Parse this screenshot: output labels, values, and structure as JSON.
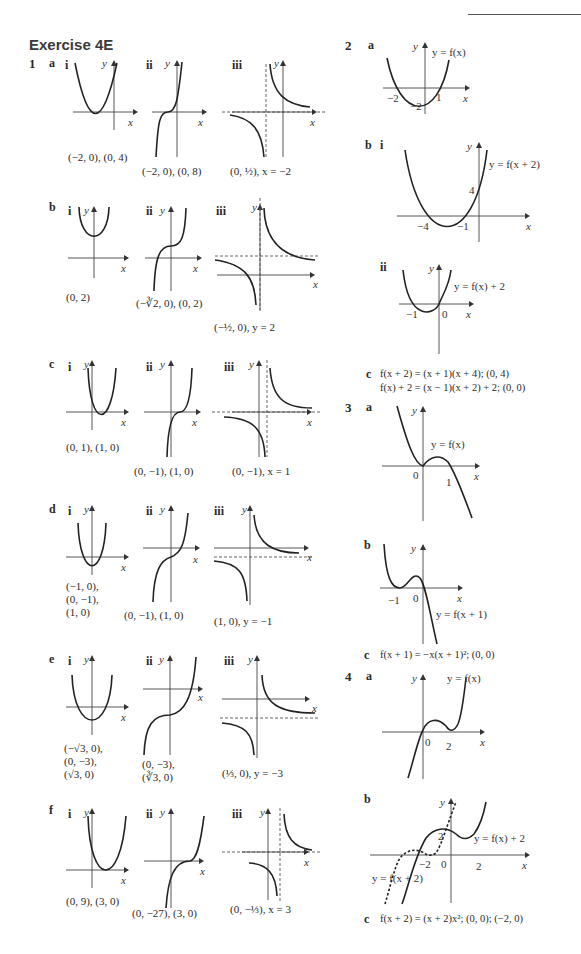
{
  "header": {
    "title": "Exercise 4E"
  },
  "q1": {
    "number": "1",
    "parts": {
      "a": {
        "label": "a",
        "i": {
          "label": "i",
          "caption": "(−2, 0), (0, 4)"
        },
        "ii": {
          "label": "ii",
          "caption": "(−2, 0), (0, 8)"
        },
        "iii": {
          "label": "iii",
          "caption": "(0, ½), x = −2"
        }
      },
      "b": {
        "label": "b",
        "i": {
          "label": "i",
          "caption": "(0, 2)"
        },
        "ii": {
          "label": "ii",
          "caption": "(−∛2, 0), (0, 2)"
        },
        "iii": {
          "label": "iii",
          "caption": "(−½, 0), y = 2"
        }
      },
      "c": {
        "label": "c",
        "i": {
          "label": "i",
          "caption": "(0, 1), (1, 0)"
        },
        "ii": {
          "label": "ii",
          "caption": "(0, −1), (1, 0)"
        },
        "iii": {
          "label": "iii",
          "caption": "(0, −1), x = 1"
        }
      },
      "d": {
        "label": "d",
        "i": {
          "label": "i",
          "caption_lines": [
            "(−1, 0),",
            "(0, −1),",
            "(1, 0)"
          ]
        },
        "ii": {
          "label": "ii",
          "caption": "(0, −1), (1, 0)"
        },
        "iii": {
          "label": "iii",
          "caption": "(1, 0), y = −1"
        }
      },
      "e": {
        "label": "e",
        "i": {
          "label": "i",
          "caption_lines": [
            "(−√3, 0),",
            "(0, −3),",
            "(√3, 0)"
          ]
        },
        "ii": {
          "label": "ii",
          "caption_lines": [
            "(0, −3),",
            "(∛3, 0)"
          ]
        },
        "iii": {
          "label": "iii",
          "caption": "(⅓, 0), y = −3"
        }
      },
      "f": {
        "label": "f",
        "i": {
          "label": "i",
          "caption": "(0, 9), (3, 0)"
        },
        "ii": {
          "label": "ii",
          "caption": "(0, −27), (3, 0)"
        },
        "iii": {
          "label": "iii",
          "caption": "(0, −⅓), x = 3"
        }
      }
    }
  },
  "q2": {
    "number": "2",
    "a": {
      "label": "a",
      "curve_label": "y = f(x)",
      "ticks": [
        "−2",
        "−2",
        "1"
      ]
    },
    "b": {
      "label": "b",
      "i": {
        "label": "i",
        "curve_label": "y = f(x + 2)",
        "ticks": [
          "−4",
          "−1",
          "4"
        ]
      },
      "ii": {
        "label": "ii",
        "curve_label": "y = f(x) + 2",
        "ticks": [
          "−1",
          "0"
        ]
      }
    },
    "c": {
      "label": "c",
      "lines": [
        "f(x + 2) = (x + 1)(x + 4); (0, 4)",
        "f(x) + 2 = (x − 1)(x + 2) + 2; (0, 0)"
      ]
    }
  },
  "q3": {
    "number": "3",
    "a": {
      "label": "a",
      "curve_label": "y = f(x)",
      "ticks": [
        "0",
        "1"
      ]
    },
    "b": {
      "label": "b",
      "curve_label": "y = f(x + 1)",
      "ticks": [
        "−1",
        "0"
      ]
    },
    "c": {
      "label": "c",
      "text": "f(x + 1) = −x(x + 1)²; (0, 0)"
    }
  },
  "q4": {
    "number": "4",
    "a": {
      "label": "a",
      "curve_label": "y = f(x)",
      "ticks": [
        "0",
        "2"
      ]
    },
    "b": {
      "label": "b",
      "curve_label_solid": "y = f(x) + 2",
      "curve_label_dashed": "y = f(x + 2)",
      "ticks": [
        "2",
        "−2",
        "0",
        "2"
      ]
    },
    "c": {
      "label": "c",
      "text": "f(x + 2) = (x + 2)x²; (0, 0); (−2, 0)"
    }
  },
  "axes": {
    "x": "x",
    "y": "y"
  }
}
